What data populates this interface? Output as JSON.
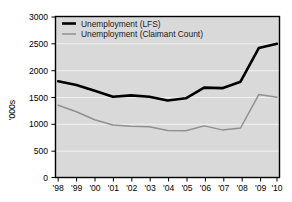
{
  "figure": {
    "clipped_header_text": "",
    "background_color": "#ffffff",
    "plot_background_color": "#d9d9d9",
    "gridline_color": "#f2f2f2",
    "border_color": "#000000"
  },
  "legend": {
    "position": "top-left-inside",
    "entries": [
      {
        "label": "Unemployment (LFS)",
        "color": "#000000",
        "line_width": "thick"
      },
      {
        "label": "Unemployment (Claimant Count)",
        "color": "#909090",
        "line_width": "thin"
      }
    ]
  },
  "axes": {
    "y": {
      "title": "'000s",
      "tick_labels": [
        "0",
        "500",
        "1000",
        "1500",
        "2000",
        "2500",
        "3000"
      ],
      "tick_values": [
        0,
        500,
        1000,
        1500,
        2000,
        2500,
        3000
      ],
      "min": 0,
      "max": 3000
    },
    "x": {
      "title": "",
      "tick_labels": [
        "'98",
        "'99",
        "'00",
        "'01",
        "'02",
        "'03",
        "'04",
        "'05",
        "'06",
        "'07",
        "'08",
        "'09",
        "'10"
      ]
    }
  },
  "chart_data": {
    "type": "line",
    "title": "",
    "subtitle": "",
    "xlabel": "",
    "ylabel": "'000s",
    "categories": [
      "'98",
      "'99",
      "'00",
      "'01",
      "'02",
      "'03",
      "'04",
      "'05",
      "'06",
      "'07",
      "'08",
      "'09",
      "'10"
    ],
    "ylim": [
      0,
      3000
    ],
    "xlim": [
      "'98",
      "'10"
    ],
    "grid": true,
    "grid_axis": "y",
    "legend_position": "upper left",
    "annotations": [],
    "series": [
      {
        "name": "Unemployment (LFS)",
        "color": "#000000",
        "values": [
          1800,
          1730,
          1620,
          1510,
          1535,
          1510,
          1440,
          1480,
          1680,
          1670,
          1790,
          2420,
          2500
        ]
      },
      {
        "name": "Unemployment (Claimant Count)",
        "color": "#909090",
        "values": [
          1350,
          1230,
          1080,
          980,
          960,
          950,
          880,
          875,
          965,
          890,
          925,
          1550,
          1500
        ]
      }
    ]
  }
}
